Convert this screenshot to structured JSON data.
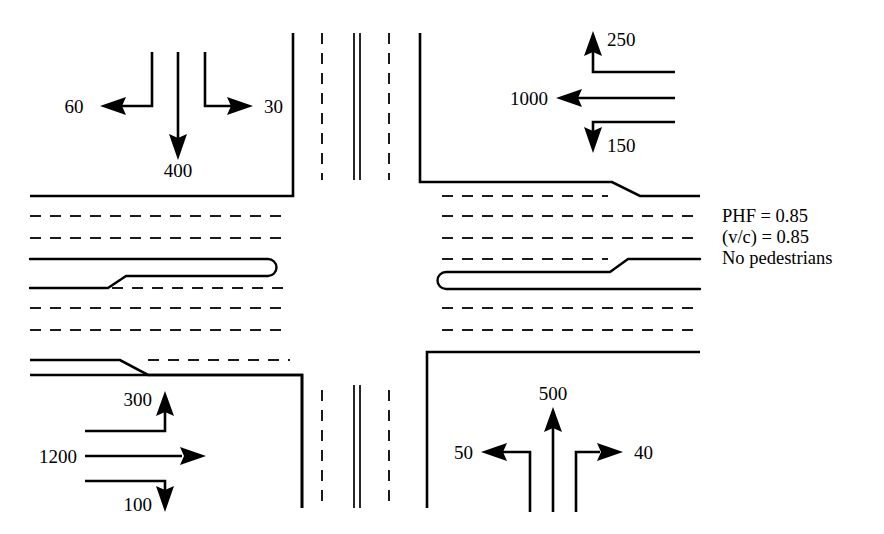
{
  "diagram": {
    "type": "intersection-volume-diagram",
    "background_color": "#ffffff",
    "line_color": "#000000"
  },
  "notes": {
    "lines": [
      "PHF = 0.85",
      "(v/c) = 0.85",
      "No pedestrians"
    ],
    "phf_label": "PHF = 0.85",
    "vc_label": "(v/c) = 0.85",
    "ped_label": "No pedestrians"
  },
  "approaches": {
    "northbound_from_north": {
      "name": "north-approach",
      "travel_direction": "southbound",
      "movements": [
        {
          "movement": "right-turn",
          "label": "60",
          "arrow": "left"
        },
        {
          "movement": "through",
          "label": "400",
          "arrow": "down"
        },
        {
          "movement": "left-turn",
          "label": "30",
          "arrow": "right"
        }
      ]
    },
    "eastbound_from_east": {
      "name": "east-approach",
      "travel_direction": "westbound",
      "movements": [
        {
          "movement": "right-turn",
          "label": "250",
          "arrow": "up"
        },
        {
          "movement": "through",
          "label": "1000",
          "arrow": "left"
        },
        {
          "movement": "left-turn",
          "label": "150",
          "arrow": "down"
        }
      ]
    },
    "westbound_from_west": {
      "name": "west-approach",
      "travel_direction": "eastbound",
      "movements": [
        {
          "movement": "left-turn",
          "label": "300",
          "arrow": "up"
        },
        {
          "movement": "through",
          "label": "1200",
          "arrow": "right"
        },
        {
          "movement": "right-turn",
          "label": "100",
          "arrow": "down"
        }
      ]
    },
    "southbound_from_south": {
      "name": "south-approach",
      "travel_direction": "northbound",
      "movements": [
        {
          "movement": "right-turn",
          "label": "50",
          "arrow": "left"
        },
        {
          "movement": "through",
          "label": "500",
          "arrow": "up"
        },
        {
          "movement": "left-turn",
          "label": "40",
          "arrow": "right"
        }
      ]
    }
  },
  "volumes": {
    "north_left": "60",
    "north_through": "400",
    "north_right": "30",
    "east_up": "250",
    "east_through": "1000",
    "east_down": "150",
    "west_up": "300",
    "west_through": "1200",
    "west_down": "100",
    "south_left": "50",
    "south_through": "500",
    "south_right": "40"
  }
}
